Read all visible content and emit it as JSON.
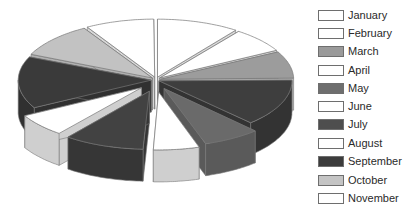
{
  "chart_data": {
    "type": "pie",
    "style": "3d-exploded",
    "title": "",
    "legend_position": "right",
    "categories": [
      "January",
      "February",
      "March",
      "April",
      "May",
      "June",
      "July",
      "August",
      "September",
      "October",
      "November"
    ],
    "values": [
      36,
      25,
      27,
      47,
      25,
      20,
      35,
      23,
      52,
      35,
      30
    ],
    "unit": "degrees (estimated share of 355)",
    "legend_colors": [
      "#ffffff",
      "#ffffff",
      "#9a9a9a",
      "#ffffff",
      "#6e6e6e",
      "#ffffff",
      "#4e4e4e",
      "#ffffff",
      "#3c3c3c",
      "#c4c4c4",
      "#ffffff"
    ],
    "slice_top_colors": [
      "#ffffff",
      "#ffffff",
      "#9c9c9c",
      "#3e3e3e",
      "#6a6a6a",
      "#ffffff",
      "#424242",
      "#ffffff",
      "#3a3a3a",
      "#c2c2c2",
      "#ffffff"
    ],
    "slice_side_colors": [
      "#d8d8d8",
      "#d8d8d8",
      "#b4b4b4",
      "#333333",
      "#5a5a5a",
      "#cfcfcf",
      "#363636",
      "#cfcfcf",
      "#303030",
      "#b0b0b0",
      "#d8d8d8"
    ],
    "explode": [
      3,
      3,
      3,
      2,
      10,
      12,
      12,
      12,
      3,
      3,
      3
    ]
  },
  "legend": {
    "items": [
      {
        "label": "January",
        "color": "#ffffff"
      },
      {
        "label": "February",
        "color": "#ffffff"
      },
      {
        "label": "March",
        "color": "#9a9a9a"
      },
      {
        "label": "April",
        "color": "#ffffff"
      },
      {
        "label": "May",
        "color": "#6e6e6e"
      },
      {
        "label": "June",
        "color": "#ffffff"
      },
      {
        "label": "July",
        "color": "#4e4e4e"
      },
      {
        "label": "August",
        "color": "#ffffff"
      },
      {
        "label": "September",
        "color": "#3c3c3c"
      },
      {
        "label": "October",
        "color": "#c4c4c4"
      },
      {
        "label": "November",
        "color": "#ffffff"
      }
    ]
  }
}
